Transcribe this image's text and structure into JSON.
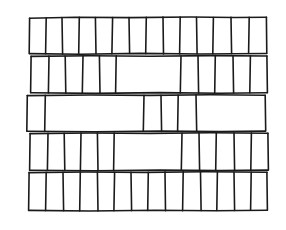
{
  "figure": {
    "type": "line-drawing",
    "background_color": "#ffffff",
    "ink_color": "#1a1a1a",
    "stroke_width": 1.6,
    "canvas": {
      "width": 286,
      "height": 230
    }
  },
  "wall": {
    "left_edge": 29,
    "right_edge": 267,
    "course_count": 5,
    "courses": [
      {
        "name": "course-1-top",
        "index": 0,
        "y_top": 17,
        "y_bottom": 54,
        "brick_count": 14,
        "joints": [
          29,
          46,
          62,
          79,
          95,
          112,
          129,
          146,
          163,
          180,
          196,
          213,
          231,
          249,
          266
        ]
      },
      {
        "name": "course-2",
        "index": 1,
        "y_top": 56,
        "y_bottom": 93,
        "brick_count": 10,
        "joints": [
          31,
          49,
          65,
          83,
          99,
          116,
          181,
          198,
          215,
          233,
          250,
          267
        ]
      },
      {
        "name": "course-3-middle",
        "index": 2,
        "y_top": 95,
        "y_bottom": 131,
        "brick_count": 7,
        "joints": [
          27,
          45,
          144,
          161,
          178,
          196,
          265
        ],
        "wide_bricks": [
          1,
          5
        ]
      },
      {
        "name": "course-4",
        "index": 3,
        "y_top": 133,
        "y_bottom": 170,
        "brick_count": 10,
        "joints": [
          30,
          48,
          64,
          81,
          97,
          114,
          182,
          199,
          216,
          234,
          251,
          268
        ]
      },
      {
        "name": "course-5-bottom",
        "index": 4,
        "y_top": 172,
        "y_bottom": 211,
        "brick_count": 13,
        "joints": [
          29,
          46,
          63,
          80,
          97,
          114,
          131,
          148,
          165,
          183,
          200,
          217,
          234,
          251,
          267
        ]
      }
    ]
  }
}
